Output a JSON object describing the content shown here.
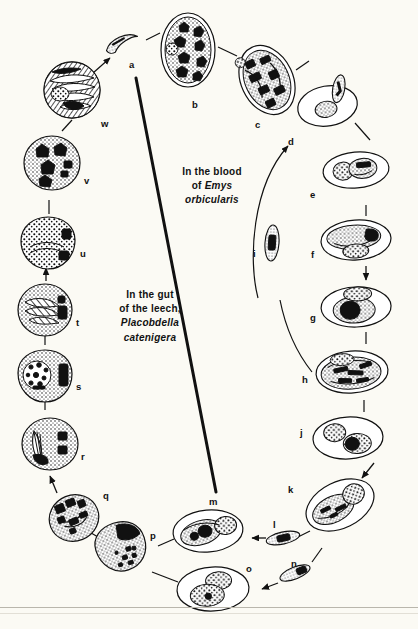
{
  "figure": {
    "background_color": "#fbfaf4",
    "ink_color": "#111111",
    "width": 418,
    "height": 629
  },
  "captions": {
    "host_blood": {
      "line1": "In the blood",
      "line2_prefix": "of ",
      "line2_species": "Emys",
      "line3_species": "orbicularis",
      "full_text": "In the blood of Emys orbicularis"
    },
    "host_vector": {
      "line1": "In the gut",
      "line2": "of the leech,",
      "line3_species": "Placobdella",
      "line4_species": "catenigera",
      "full_text": "In the gut of the leech, Placobdella catenigera"
    }
  },
  "stages": [
    {
      "id": "a",
      "label": "a",
      "label_x": 129,
      "label_y": 60,
      "shape": "crescent-sporozoite",
      "cx": 122,
      "cy": 43,
      "rx": 16,
      "ry": 7,
      "rot": -20
    },
    {
      "id": "b",
      "label": "b",
      "label_x": 192,
      "label_y": 100,
      "shape": "oval-many-nuclei",
      "cx": 188,
      "cy": 50,
      "rx": 27,
      "ry": 37,
      "rot": 0
    },
    {
      "id": "c",
      "label": "c",
      "label_x": 255,
      "label_y": 120,
      "shape": "oval-dark-meront",
      "cx": 267,
      "cy": 80,
      "rx": 26,
      "ry": 36,
      "rot": -25
    },
    {
      "id": "d",
      "label": "d",
      "label_x": 288,
      "label_y": 137,
      "shape": "oval-cell-with-parasite",
      "cx": 327,
      "cy": 103,
      "rx": 30,
      "ry": 20,
      "rot": -12
    },
    {
      "id": "e",
      "label": "e",
      "label_x": 310,
      "label_y": 190,
      "shape": "oval-two-bodies",
      "cx": 356,
      "cy": 170,
      "rx": 33,
      "ry": 18,
      "rot": -5
    },
    {
      "id": "f",
      "label": "f",
      "label_x": 310,
      "label_y": 250,
      "shape": "oval-elongate-nucleus",
      "cx": 356,
      "cy": 240,
      "rx": 35,
      "ry": 20,
      "rot": -4
    },
    {
      "id": "g",
      "label": "g",
      "label_x": 310,
      "label_y": 313,
      "shape": "oval-round-nucleus",
      "cx": 356,
      "cy": 305,
      "rx": 35,
      "ry": 20,
      "rot": -2
    },
    {
      "id": "h",
      "label": "h",
      "label_x": 302,
      "label_y": 375,
      "shape": "oval-striate-meront",
      "cx": 352,
      "cy": 372,
      "rx": 36,
      "ry": 21,
      "rot": -4
    },
    {
      "id": "i",
      "label": "i",
      "label_x": 253,
      "label_y": 249,
      "shape": "rod-merozoite-vertical",
      "cx": 272,
      "cy": 243,
      "rx": 7,
      "ry": 17,
      "rot": 5
    },
    {
      "id": "j",
      "label": "j",
      "label_x": 300,
      "label_y": 428,
      "shape": "oval-two-nuclei",
      "cx": 348,
      "cy": 438,
      "rx": 35,
      "ry": 21,
      "rot": -3
    },
    {
      "id": "k",
      "label": "k",
      "label_x": 288,
      "label_y": 485,
      "shape": "oval-gamont-pair",
      "cx": 340,
      "cy": 505,
      "rx": 36,
      "ry": 23,
      "rot": -25
    },
    {
      "id": "l",
      "label": "l",
      "label_x": 272,
      "label_y": 520,
      "shape": "rod-merozoite",
      "cx": 283,
      "cy": 538,
      "rx": 16,
      "ry": 6,
      "rot": -12
    },
    {
      "id": "m",
      "label": "m",
      "label_x": 211,
      "label_y": 497,
      "shape": "oval-syzygy",
      "cx": 208,
      "cy": 531,
      "rx": 35,
      "ry": 21,
      "rot": -5
    },
    {
      "id": "n",
      "label": "n",
      "label_x": 291,
      "label_y": 559,
      "shape": "rod-merozoite",
      "cx": 295,
      "cy": 573,
      "rx": 15,
      "ry": 6,
      "rot": -22
    },
    {
      "id": "o",
      "label": "o",
      "label_x": 246,
      "label_y": 564,
      "shape": "oval-two-gamonts",
      "cx": 213,
      "cy": 589,
      "rx": 36,
      "ry": 22,
      "rot": -3
    },
    {
      "id": "p",
      "label": "p",
      "label_x": 150,
      "label_y": 531,
      "shape": "round-zygote-dark-cap",
      "cx": 121,
      "cy": 547,
      "rx": 25,
      "ry": 24,
      "rot": -18
    },
    {
      "id": "q",
      "label": "q",
      "label_x": 103,
      "label_y": 491,
      "shape": "round-oocyst-blocks",
      "cx": 74,
      "cy": 518,
      "rx": 25,
      "ry": 23,
      "rot": -22
    },
    {
      "id": "r",
      "label": "r",
      "label_x": 81,
      "label_y": 452,
      "shape": "round-oocyst-spindle",
      "cx": 50,
      "cy": 444,
      "rx": 28,
      "ry": 26,
      "rot": 0
    },
    {
      "id": "s",
      "label": "s",
      "label_x": 76,
      "label_y": 382,
      "shape": "round-oocyst-granular",
      "cx": 45,
      "cy": 376,
      "rx": 27,
      "ry": 26,
      "rot": 0
    },
    {
      "id": "t",
      "label": "t",
      "label_x": 76,
      "label_y": 318,
      "shape": "round-oocyst-striate",
      "cx": 45,
      "cy": 310,
      "rx": 27,
      "ry": 26,
      "rot": 0
    },
    {
      "id": "u",
      "label": "u",
      "label_x": 80,
      "label_y": 249,
      "shape": "round-oocyst-stippled",
      "cx": 48,
      "cy": 243,
      "rx": 27,
      "ry": 26,
      "rot": 0
    },
    {
      "id": "v",
      "label": "v",
      "label_x": 84,
      "label_y": 176,
      "shape": "round-oocyst-four-nuclei",
      "cx": 52,
      "cy": 163,
      "rx": 28,
      "ry": 27,
      "rot": 0
    },
    {
      "id": "w",
      "label": "w",
      "label_x": 101,
      "label_y": 119,
      "shape": "round-sporoblast-rays",
      "cx": 72,
      "cy": 90,
      "rx": 28,
      "ry": 27,
      "rot": 0
    }
  ],
  "divider": {
    "name": "compartment-divider",
    "x1": 136,
    "y1": 78,
    "x2": 216,
    "y2": 492,
    "stroke_width": 3
  },
  "footer_rules": [
    {
      "y": 607,
      "color": "#b9b6ac"
    },
    {
      "y": 613,
      "color": "#e2dfd6"
    }
  ]
}
